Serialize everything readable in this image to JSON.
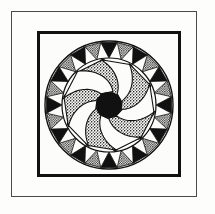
{
  "figure": {
    "title": "Rosette Pinwheel Woodcut",
    "medium": "black and white relief print",
    "background_color": "#fdfdfb",
    "ink_color": "#111111",
    "stipple_color": "#8a8a8a"
  },
  "frames": {
    "outer": {
      "name": "outer-thin-rule",
      "color": "#4a4a4a",
      "stroke_width": 1,
      "x": 11,
      "y": 11,
      "width": 186,
      "height": 186
    },
    "inner": {
      "name": "inner-heavy-block",
      "color": "#111111",
      "stroke_width": 3,
      "x": 37,
      "y": 31,
      "width": 144,
      "height": 146
    }
  },
  "rosette": {
    "center_x": 72,
    "center_y": 74,
    "outer_radius": 64,
    "ring_outline_color": "#111111",
    "sawtooth": {
      "count": 24,
      "direction": "inward-pointing",
      "outer_radius": 63,
      "inner_radius": 47,
      "fill_alternation": [
        "solid",
        "stipple"
      ],
      "solid_color": "#111111",
      "stipple_color": "#9a9a9a"
    },
    "pinwheel": {
      "blade_count": 10,
      "rotation_direction": "counter-clockwise",
      "inner_radius": 14,
      "outer_radius": 46,
      "sweep_degrees": 52,
      "curve_degrees": 46,
      "fill_alternation": [
        "stipple",
        "white"
      ],
      "stipple_color": "#9a9a9a",
      "white_color": "#fcfcfa",
      "outline_color": "#111111"
    },
    "hub": {
      "name": "center-hub-disc",
      "radius": 13,
      "fill": "#111111"
    }
  }
}
